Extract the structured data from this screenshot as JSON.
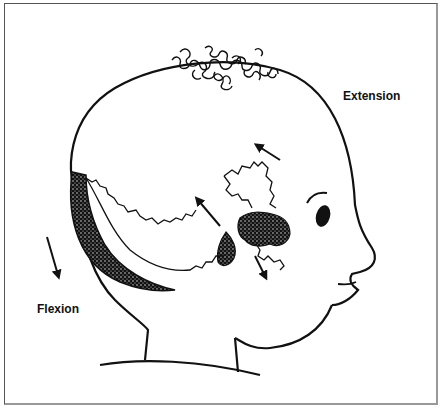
{
  "diagram": {
    "labels": {
      "extension": "Extension",
      "flexion": "Flexion"
    },
    "colors": {
      "line": "#111111",
      "background": "#ffffff",
      "frame": "#555555"
    }
  }
}
